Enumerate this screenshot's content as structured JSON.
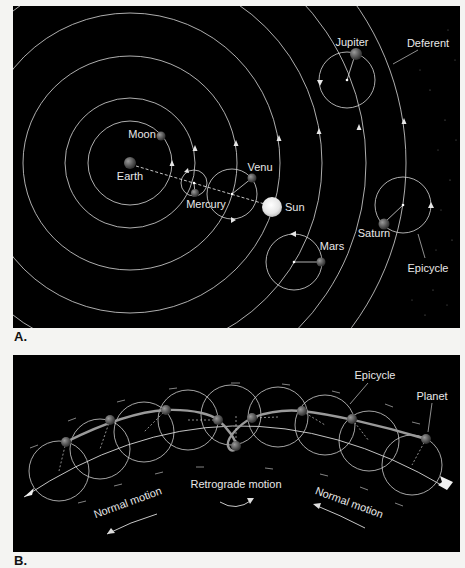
{
  "panel_a": {
    "letter": "A.",
    "labels": {
      "moon": "Moon",
      "earth": "Earth",
      "mercury": "Mercury",
      "venus": "Venu",
      "sun": "Sun",
      "mars": "Mars",
      "jupiter": "Jupiter",
      "saturn": "Saturn",
      "deferent": "Deferent",
      "epicycle": "Epicycle"
    }
  },
  "panel_b": {
    "letter": "B.",
    "labels": {
      "epicycle": "Epicycle",
      "planet": "Planet",
      "retrograde": "Retrograde motion",
      "normal_left": "Normal motion",
      "normal_right": "Normal motion"
    }
  },
  "colors": {
    "background": "#000000",
    "line": "#d9d9d9",
    "page": "#f4f4f2",
    "sun": "#f2f2f2",
    "planet": "#6a6a6a"
  }
}
